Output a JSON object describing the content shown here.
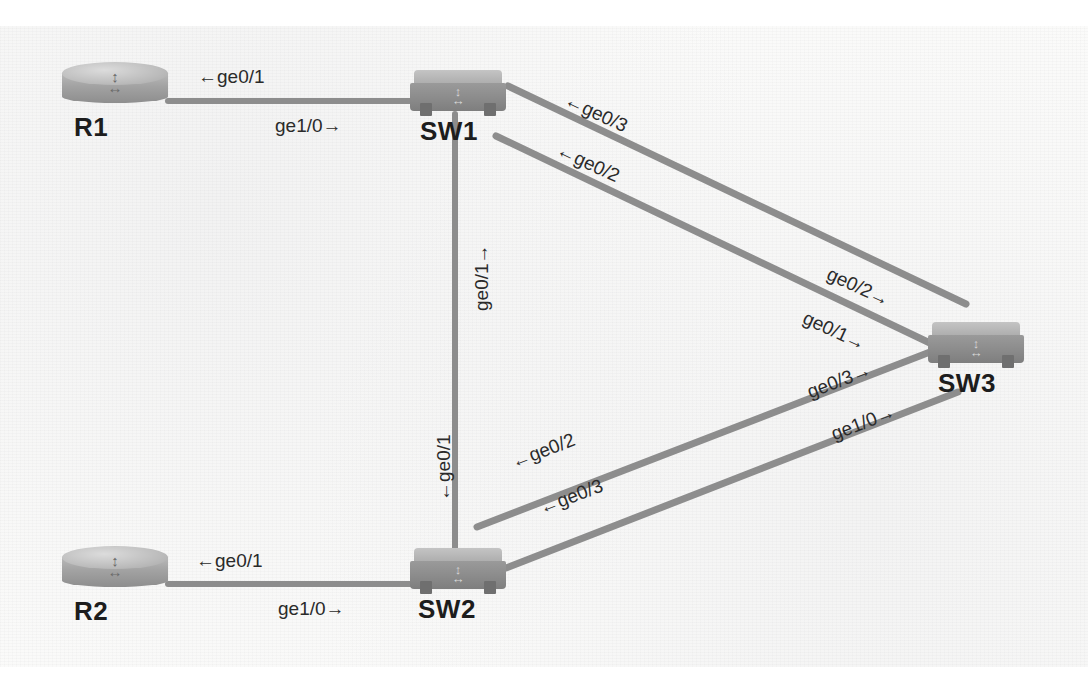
{
  "diagram": {
    "colors": {
      "link": "#8d8d8d",
      "node_label": "#1d1d1d",
      "interface_label": "#2a2a2a",
      "background": "#fbfbfa"
    }
  },
  "nodes": [
    {
      "id": "R1",
      "label": "R1",
      "type": "router",
      "x": 62,
      "y": 62,
      "w": 106,
      "h": 44,
      "label_x": 74,
      "label_y": 112
    },
    {
      "id": "SW1",
      "label": "SW1",
      "type": "switch",
      "x": 410,
      "y": 70,
      "w": 96,
      "h": 42,
      "label_x": 420,
      "label_y": 116
    },
    {
      "id": "SW3",
      "label": "SW3",
      "type": "switch",
      "x": 928,
      "y": 322,
      "w": 96,
      "h": 42,
      "label_x": 938,
      "label_y": 368
    },
    {
      "id": "R2",
      "label": "R2",
      "type": "router",
      "x": 62,
      "y": 546,
      "w": 106,
      "h": 44,
      "label_x": 74,
      "label_y": 596
    },
    {
      "id": "SW2",
      "label": "SW2",
      "type": "switch",
      "x": 410,
      "y": 548,
      "w": 96,
      "h": 42,
      "label_x": 418,
      "label_y": 594
    }
  ],
  "links": [
    {
      "id": "r1-sw1",
      "from": "R1",
      "to": "SW1",
      "x1": 168,
      "y1": 101,
      "x2": 412,
      "y2": 101,
      "width": 6,
      "labels": [
        {
          "text": "←ge0/1",
          "x": 198,
          "y": 66,
          "rotate": 0,
          "endpoint": "R1"
        },
        {
          "text": "ge1/0→",
          "x": 275,
          "y": 115,
          "rotate": 0,
          "endpoint": "SW1"
        }
      ]
    },
    {
      "id": "sw1-sw2",
      "from": "SW1",
      "to": "SW2",
      "x1": 455,
      "y1": 114,
      "x2": 455,
      "y2": 552,
      "width": 6,
      "labels": [
        {
          "text": "ge0/1→",
          "x": 482,
          "y": 300,
          "rotate": -90,
          "endpoint": "SW1"
        },
        {
          "text": "←ge0/1",
          "x": 444,
          "y": 490,
          "rotate": -90,
          "endpoint": "SW2"
        }
      ]
    },
    {
      "id": "sw1-sw3-a",
      "from": "SW1",
      "to": "SW3",
      "x1": 508,
      "y1": 86,
      "x2": 966,
      "y2": 304,
      "width": 7,
      "labels": [
        {
          "text": "←ge0/3",
          "x": 566,
          "y": 88,
          "rotate": 25,
          "endpoint": "SW1"
        },
        {
          "text": "ge0/2→",
          "x": 828,
          "y": 262,
          "rotate": 25,
          "endpoint": "SW3"
        }
      ]
    },
    {
      "id": "sw1-sw3-b",
      "from": "SW1",
      "to": "SW3",
      "x1": 496,
      "y1": 136,
      "x2": 932,
      "y2": 344,
      "width": 7,
      "labels": [
        {
          "text": "←ge0/2",
          "x": 558,
          "y": 138,
          "rotate": 25,
          "endpoint": "SW1"
        },
        {
          "text": "ge0/1→",
          "x": 804,
          "y": 306,
          "rotate": 25,
          "endpoint": "SW3"
        }
      ]
    },
    {
      "id": "sw2-sw3-a",
      "from": "SW2",
      "to": "SW3",
      "x1": 477,
      "y1": 527,
      "x2": 930,
      "y2": 352,
      "width": 7,
      "labels": [
        {
          "text": "←ge0/2",
          "x": 512,
          "y": 452,
          "rotate": -21,
          "endpoint": "SW2"
        },
        {
          "text": "ge0/3→",
          "x": 808,
          "y": 382,
          "rotate": -21,
          "endpoint": "SW3"
        }
      ]
    },
    {
      "id": "sw2-sw3-b",
      "from": "SW2",
      "to": "SW3",
      "x1": 506,
      "y1": 568,
      "x2": 958,
      "y2": 392,
      "width": 7,
      "labels": [
        {
          "text": "←ge0/3",
          "x": 540,
          "y": 498,
          "rotate": -21,
          "endpoint": "SW2"
        },
        {
          "text": "ge1/0→",
          "x": 832,
          "y": 424,
          "rotate": -21,
          "endpoint": "SW3"
        }
      ]
    },
    {
      "id": "r2-sw2",
      "from": "R2",
      "to": "SW2",
      "x1": 168,
      "y1": 584,
      "x2": 412,
      "y2": 584,
      "width": 6,
      "labels": [
        {
          "text": "←ge0/1",
          "x": 196,
          "y": 550,
          "rotate": 0,
          "endpoint": "R2"
        },
        {
          "text": "ge1/0→",
          "x": 278,
          "y": 598,
          "rotate": 0,
          "endpoint": "SW2"
        }
      ]
    }
  ]
}
